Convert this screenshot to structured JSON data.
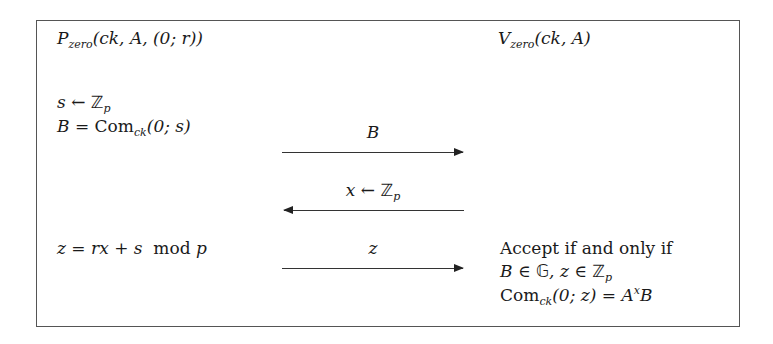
{
  "prover": {
    "name": "P",
    "subscript": "zero",
    "args": "(ck, A, (0; r))",
    "steps": [
      {
        "lhs": "s",
        "op": " ← ",
        "rhs": "ℤ",
        "rhs_sub": "p"
      },
      {
        "lhs": "B",
        "op": " = ",
        "rhs": "Com",
        "rhs_sub": "ck",
        "tail": "(0; s)"
      }
    ],
    "response": {
      "expr": "z = rx + s",
      "mod": "mod",
      "modulus": "p"
    }
  },
  "verifier": {
    "name": "V",
    "subscript": "zero",
    "args": "(ck, A)",
    "accept_text": "Accept if and only if",
    "check1": {
      "a": "B ∈ ",
      "group": "𝔾",
      "b": ", z ∈ ",
      "field": "ℤ",
      "field_sub": "p"
    },
    "check2": {
      "com": "Com",
      "com_sub": "ck",
      "args": "(0; z) = A",
      "exp": "x",
      "tail": "B"
    }
  },
  "messages": [
    {
      "label": "B",
      "direction": "right"
    },
    {
      "label_var": "x",
      "label_op": " ← ",
      "label_set": "ℤ",
      "label_sub": "p",
      "direction": "left"
    },
    {
      "label": "z",
      "direction": "right"
    }
  ]
}
